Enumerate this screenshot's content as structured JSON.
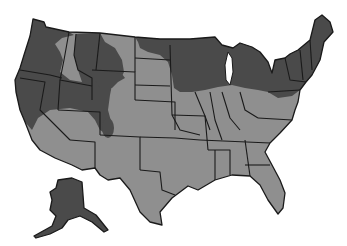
{
  "map": {
    "type": "choropleth",
    "region": "United States",
    "legend": [],
    "colors": {
      "background": "#ffffff",
      "light_region": "#8f8f8f",
      "dark_region": "#4a4a4a",
      "borders": "#1a1a1a"
    },
    "shaded_dark_regions": [
      "Pacific Northwest (Washington, Oregon, northern California)",
      "Northern Idaho / western Montana",
      "Nevada / Utah / western Colorado mountain band",
      "Wyoming (partial)",
      "Northern Great Plains edge (North Dakota east, Minnesota)",
      "Wisconsin, Michigan",
      "Northeast (New York, Pennsylvania north, New England)",
      "Alaska"
    ],
    "shaded_light_regions": [
      "Southern and central states",
      "Southwest (Arizona, New Mexico, Texas)",
      "Southeast (Florida, Georgia, Alabama)",
      "Central plains and Midwest south of Great Lakes"
    ]
  }
}
